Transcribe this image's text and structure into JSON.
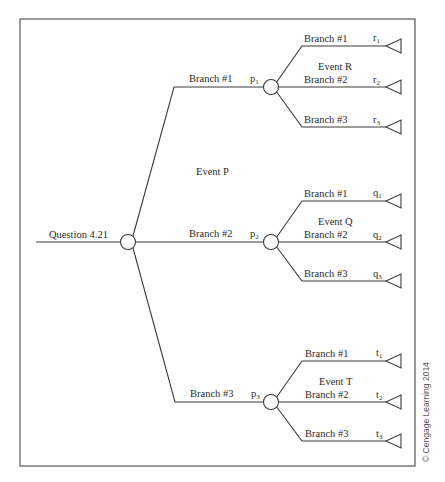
{
  "root": {
    "label": "Question 4.21"
  },
  "chance_event_label": "Event P",
  "first_level_branches": [
    {
      "label": "Branch #1",
      "prob": "p",
      "prob_sub": "1"
    },
    {
      "label": "Branch #2",
      "prob": "p",
      "prob_sub": "2"
    },
    {
      "label": "Branch #3",
      "prob": "p",
      "prob_sub": "3"
    }
  ],
  "sub_events": [
    {
      "event_label": "Event R",
      "branches": [
        {
          "label": "Branch #1",
          "prob": "r",
          "prob_sub": "1"
        },
        {
          "label": "Branch #2",
          "prob": "r",
          "prob_sub": "2"
        },
        {
          "label": "Branch #3",
          "prob": "r",
          "prob_sub": "3"
        }
      ]
    },
    {
      "event_label": "Event Q",
      "branches": [
        {
          "label": "Branch #1",
          "prob": "q",
          "prob_sub": "1"
        },
        {
          "label": "Branch #2",
          "prob": "q",
          "prob_sub": "2"
        },
        {
          "label": "Branch #3",
          "prob": "q",
          "prob_sub": "3"
        }
      ]
    },
    {
      "event_label": "Event T",
      "branches": [
        {
          "label": "Branch #1",
          "prob": "t",
          "prob_sub": "1"
        },
        {
          "label": "Branch #2",
          "prob": "t",
          "prob_sub": "2"
        },
        {
          "label": "Branch #3",
          "prob": "t",
          "prob_sub": "3"
        }
      ]
    }
  ],
  "copyright": "© Cengage Learning 2014"
}
